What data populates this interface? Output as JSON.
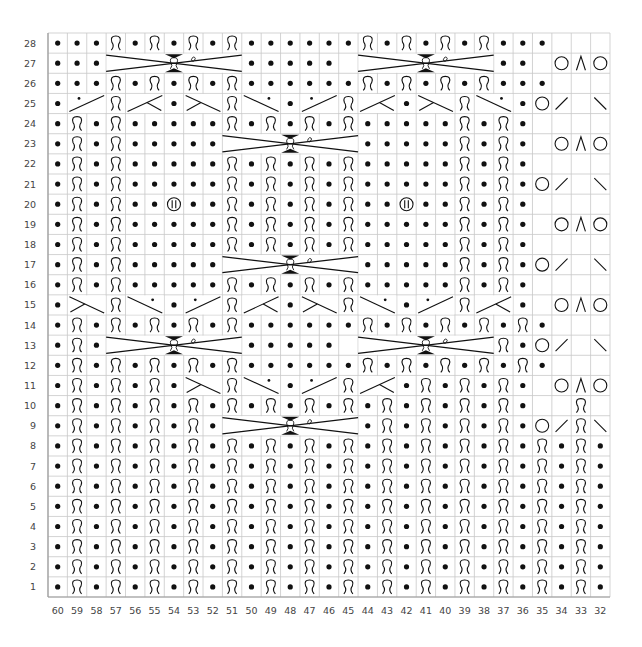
{
  "chart_data": {
    "type": "table",
    "title": "",
    "columns": [
      60,
      59,
      58,
      57,
      56,
      55,
      54,
      53,
      52,
      51,
      50,
      49,
      48,
      47,
      46,
      45,
      44,
      43,
      42,
      41,
      40,
      39,
      38,
      37,
      36,
      35,
      34,
      33,
      32
    ],
    "row_numbers": [
      28,
      27,
      26,
      25,
      24,
      23,
      22,
      21,
      20,
      19,
      18,
      17,
      16,
      15,
      14,
      13,
      12,
      11,
      10,
      9,
      8,
      7,
      6,
      5,
      4,
      3,
      2,
      1
    ],
    "legend": {
      "p": "purl (dot)",
      "k": "knit through back loop (twisted)",
      "e": "empty / no stitch",
      "O": "yarn over",
      "A": "central double decrease",
      "/": "right-leaning slant",
      "\\": "left-leaning slant",
      "B": "bobble",
      "x": "covered by cable/slant symbol"
    },
    "rows": {
      "28": "pppkpkpkpkppppppkpkpkpkpppeee",
      "27": "pppxxxxxxxpppppxxxxxxxpppeOAO",
      "26": "pppkpkpkpkppppppkpkpkpkpppeee",
      "25": "pxxkxxpxxkxxpxxkxxpxxkxxpO/e\\",
      "24": "pkpkpppppkpkpkpkpppppkpkpeeee",
      "23": "pkpkpppppxxxxxxxpppppkpkpeOAO",
      "22": "pkpkpppppkpkpkpkpppppkpkpeeee",
      "21": "pkpkpppppkpkpkpkpppppkpkpO/e\\",
      "20": "pkpkppBppkpkpkpkppBppkpkpeeee",
      "19": "pkpkpppppkpkpkpkpppppkpkpeOAO",
      "18": "pkpkpppppkpkpkpkpppppkpkpeeee",
      "17": "pkpkpppppxxxxxxxpppppkpkpO/e\\",
      "16": "pkpkpppppkpkpkpkpppppkpkpeeee",
      "15": "pxxkxxpxxkxxpxxkxxpxxkxxpeOAO",
      "14": "pkpkpkpkpkppppppkpkpkpkpkpeee",
      "13": "pkpxxxxxxxpppppxxxxxxxpkpO/e\\",
      "12": "pkpkpkpkpkppppppkpkpkpkpkpeee",
      "11": "pkpkpkpxxkxxpxxkxxpkpkpkpeOAO",
      "10": "pkpkpkpkpkpkpkpkpkpkpkpkpeeke",
      "9": "pkpkpkpkpxxxxxxxpkpkpkpkpO/k\\",
      "8": "pkpkpkpkpkpkpkpkpkpkpkpkpkpkp",
      "7": "pkpkpkpkpkpkpkpkpkpkpkpkpkpkp",
      "6": "pkpkpkpkpkpkpkpkpkpkpkpkpkpkp",
      "5": "pkpkpkpkpkpkpkpkpkpkpkpkpkpkp",
      "4": "pkpkpkpkpkpkpkpkpkpkpkpkpkpkp",
      "3": "pkpkpkpkpkpkpkpkpkpkpkpkpkpkp",
      "2": "pkpkpkpkpkpkpkpkpkpkpkpkpkpkp",
      "1": "pkpkpkpkpkpkpkpkpkpkpkpkpkpkp"
    },
    "cables": [
      {
        "row": 27,
        "from_col": 57,
        "to_col": 51
      },
      {
        "row": 27,
        "from_col": 44,
        "to_col": 38
      },
      {
        "row": 23,
        "from_col": 51,
        "to_col": 45
      },
      {
        "row": 17,
        "from_col": 51,
        "to_col": 45
      },
      {
        "row": 13,
        "from_col": 57,
        "to_col": 51
      },
      {
        "row": 13,
        "from_col": 44,
        "to_col": 38
      },
      {
        "row": 9,
        "from_col": 51,
        "to_col": 45
      }
    ],
    "slants": [
      {
        "row": 25,
        "from_col": 59,
        "to_col": 58,
        "dir": "up",
        "dot": true
      },
      {
        "row": 25,
        "from_col": 56,
        "to_col": 55,
        "dir": "up-tick"
      },
      {
        "row": 25,
        "from_col": 53,
        "to_col": 52,
        "dir": "down-tick"
      },
      {
        "row": 25,
        "from_col": 50,
        "to_col": 49,
        "dir": "down",
        "dot": true
      },
      {
        "row": 25,
        "from_col": 47,
        "to_col": 46,
        "dir": "up",
        "dot": true
      },
      {
        "row": 25,
        "from_col": 44,
        "to_col": 43,
        "dir": "up-tick"
      },
      {
        "row": 25,
        "from_col": 41,
        "to_col": 40,
        "dir": "down-tick"
      },
      {
        "row": 25,
        "from_col": 38,
        "to_col": 37,
        "dir": "down",
        "dot": true
      },
      {
        "row": 15,
        "from_col": 59,
        "to_col": 58,
        "dir": "down-tick"
      },
      {
        "row": 15,
        "from_col": 56,
        "to_col": 55,
        "dir": "down",
        "dot": true
      },
      {
        "row": 15,
        "from_col": 53,
        "to_col": 52,
        "dir": "up",
        "dot": true
      },
      {
        "row": 15,
        "from_col": 50,
        "to_col": 49,
        "dir": "up-tick"
      },
      {
        "row": 15,
        "from_col": 47,
        "to_col": 46,
        "dir": "down-tick"
      },
      {
        "row": 15,
        "from_col": 44,
        "to_col": 43,
        "dir": "down",
        "dot": true
      },
      {
        "row": 15,
        "from_col": 41,
        "to_col": 40,
        "dir": "up",
        "dot": true
      },
      {
        "row": 15,
        "from_col": 38,
        "to_col": 37,
        "dir": "up-tick"
      },
      {
        "row": 11,
        "from_col": 53,
        "to_col": 52,
        "dir": "down-tick"
      },
      {
        "row": 11,
        "from_col": 50,
        "to_col": 49,
        "dir": "down",
        "dot": true
      },
      {
        "row": 11,
        "from_col": 47,
        "to_col": 46,
        "dir": "up",
        "dot": true
      },
      {
        "row": 11,
        "from_col": 44,
        "to_col": 43,
        "dir": "up-tick"
      }
    ],
    "xlabel": "",
    "ylabel": "",
    "grid": true
  },
  "colors": {
    "grid_line": "#c8c8c8",
    "border": "#9a9a9a",
    "symbol": "#111111",
    "label": "#444444",
    "background": "#ffffff"
  }
}
